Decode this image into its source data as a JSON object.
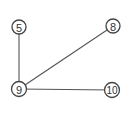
{
  "graph": {
    "nodes": [
      {
        "id": "5",
        "label": "5",
        "x": 19,
        "y": 27
      },
      {
        "id": "8",
        "label": "8",
        "x": 113,
        "y": 26
      },
      {
        "id": "9",
        "label": "9",
        "x": 19,
        "y": 89
      },
      {
        "id": "10",
        "label": "10",
        "x": 112,
        "y": 90
      }
    ],
    "edges": [
      {
        "from": "9",
        "to": "5"
      },
      {
        "from": "9",
        "to": "8"
      },
      {
        "from": "9",
        "to": "10"
      }
    ]
  }
}
